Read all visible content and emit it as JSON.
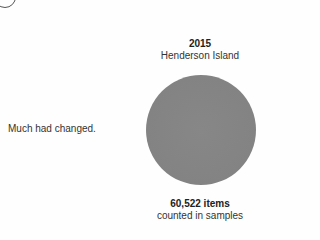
{
  "side_caption": "Much had changed.",
  "panel": {
    "year": "2015",
    "location": "Henderson Island",
    "circle_color": "#848484",
    "count_label": "60,522 items",
    "count_sublabel": "counted in samples"
  }
}
